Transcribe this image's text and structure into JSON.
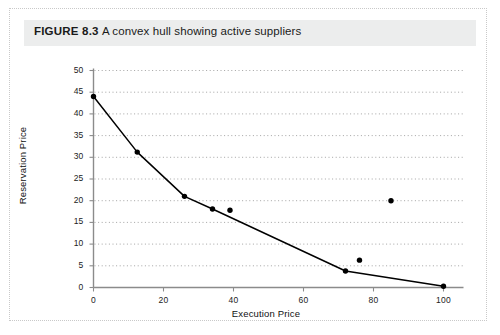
{
  "figure": {
    "label": "FIGURE 8.3",
    "caption": "A convex hull showing active suppliers",
    "full_caption": "FIGURE 8.3 A convex hull showing active suppliers"
  },
  "colors": {
    "band_background": "#eceded",
    "page_background": "#ffffff",
    "frame_border": "#c9c9c9",
    "axis_line": "#8b8b8b",
    "gridline": "#9a9a9a",
    "curve": "#000000",
    "marker": "#000000",
    "text": "#1a1a1a"
  },
  "chart_data": {
    "type": "scatter",
    "title": "",
    "xlabel": "Execution Price",
    "ylabel": "Reservation Price",
    "xlim": [
      0,
      100
    ],
    "ylim": [
      0,
      50
    ],
    "xticks": [
      0,
      20,
      40,
      60,
      80,
      100
    ],
    "yticks": [
      0,
      5,
      10,
      15,
      20,
      25,
      30,
      35,
      40,
      45,
      50
    ],
    "xtick_labels": [
      "0",
      "20",
      "40",
      "60",
      "80",
      "100"
    ],
    "ytick_labels": [
      "0",
      "5",
      "10",
      "15",
      "20",
      "25",
      "30",
      "35",
      "40",
      "45",
      "50"
    ],
    "grid": "horizontal-dotted",
    "legend": null,
    "series": [
      {
        "name": "Convex hull",
        "type": "line",
        "x": [
          0,
          12.5,
          26,
          34,
          72,
          100
        ],
        "y": [
          44,
          31.2,
          21,
          18.1,
          3.8,
          0.3
        ]
      },
      {
        "name": "Active suppliers (hull vertices)",
        "type": "scatter",
        "x": [
          0,
          12.5,
          26,
          34,
          72,
          100
        ],
        "y": [
          44,
          31.2,
          21,
          18.1,
          3.8,
          0.3
        ]
      },
      {
        "name": "Inactive suppliers (off hull)",
        "type": "scatter",
        "x": [
          39,
          76,
          85
        ],
        "y": [
          17.8,
          6.3,
          20
        ]
      }
    ]
  }
}
